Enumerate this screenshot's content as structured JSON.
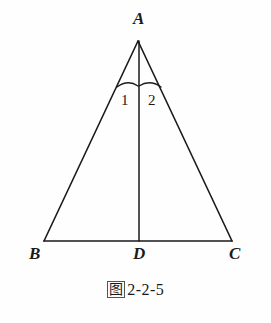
{
  "figure": {
    "type": "geometry-diagram",
    "shape": "isosceles-triangle",
    "background_color": "#fefefe",
    "line_color": "#1a1a1a",
    "vertices": {
      "apex": {
        "label": "A",
        "x": 138,
        "y": 40
      },
      "bottom_left": {
        "label": "B",
        "x": 44,
        "y": 241
      },
      "bottom_right": {
        "label": "C",
        "x": 232,
        "y": 241
      },
      "foot": {
        "label": "D",
        "x": 139,
        "y": 241
      }
    },
    "segments": [
      {
        "name": "AB",
        "from": "A",
        "to": "B"
      },
      {
        "name": "BC",
        "from": "B",
        "to": "C"
      },
      {
        "name": "CA",
        "from": "C",
        "to": "A"
      },
      {
        "name": "AD",
        "from": "A",
        "to": "D"
      }
    ],
    "angles": [
      {
        "name": "angle-1",
        "label": "1",
        "vertex": "A",
        "between": [
          "AB",
          "AD"
        ]
      },
      {
        "name": "angle-2",
        "label": "2",
        "vertex": "A",
        "between": [
          "AD",
          "AC"
        ]
      }
    ]
  },
  "caption": {
    "prefix": "图",
    "number": "2-2-5",
    "full": "图 2-2-5"
  }
}
